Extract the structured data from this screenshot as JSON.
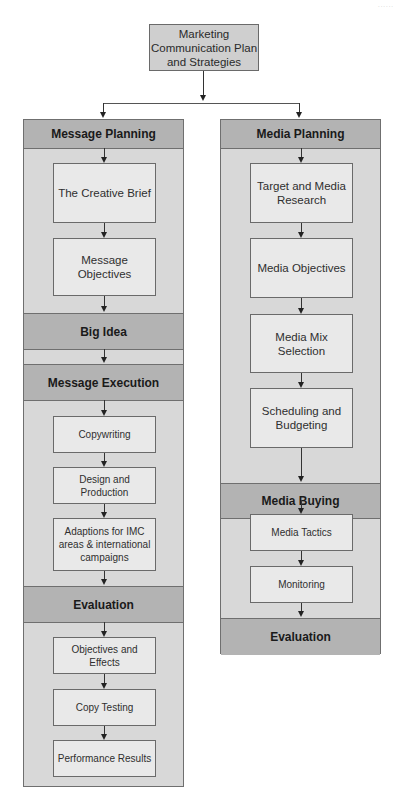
{
  "diagram": {
    "corner_mark": "......",
    "root": {
      "label": "Marketing Communication Plan and Strategies"
    },
    "left_column": {
      "bands": [
        {
          "label": "Message Planning"
        },
        {
          "label": "Big Idea"
        },
        {
          "label": "Message Execution"
        },
        {
          "label": "Evaluation"
        }
      ],
      "steps": [
        {
          "label": "The Creative Brief",
          "group": "Message Planning"
        },
        {
          "label": "Message Objectives",
          "group": "Message Planning"
        },
        {
          "label": "Copywriting",
          "group": "Message Execution"
        },
        {
          "label": "Design and Production",
          "group": "Message Execution"
        },
        {
          "label": "Adaptions for IMC areas & international campaigns",
          "group": "Message Execution"
        },
        {
          "label": "Objectives and Effects",
          "group": "Evaluation"
        },
        {
          "label": "Copy Testing",
          "group": "Evaluation"
        },
        {
          "label": "Performance Results",
          "group": "Evaluation"
        }
      ]
    },
    "right_column": {
      "bands": [
        {
          "label": "Media Planning"
        },
        {
          "label": "Media Buying"
        },
        {
          "label": "Evaluation"
        }
      ],
      "steps": [
        {
          "label": "Target and Media Research",
          "group": "Media Planning"
        },
        {
          "label": "Media Objectives",
          "group": "Media Planning"
        },
        {
          "label": "Media Mix Selection",
          "group": "Media Planning"
        },
        {
          "label": "Scheduling and Budgeting",
          "group": "Media Planning"
        },
        {
          "label": "Media Tactics",
          "group": "Media Buying"
        },
        {
          "label": "Monitoring",
          "group": "Media Buying"
        }
      ]
    },
    "colors": {
      "band_fill": "#b3b3b3",
      "column_fill": "#d8d8d8",
      "step_fill": "#e9e9e9",
      "root_fill": "#cfcfcf",
      "border": "#6a6a6a"
    }
  }
}
